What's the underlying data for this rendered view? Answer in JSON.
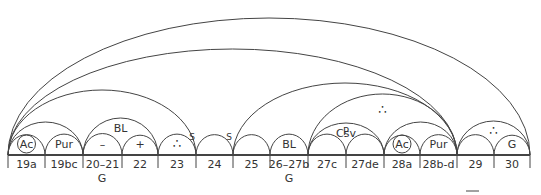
{
  "diagram": {
    "baseline_y": 155,
    "stroke_color": "#444444",
    "cells": [
      {
        "label": "19a",
        "x0": 8,
        "x1": 45,
        "symbol": "Ac",
        "circled": true
      },
      {
        "label": "19bc",
        "x0": 45,
        "x1": 83,
        "symbol": "Pur",
        "circled": false
      },
      {
        "label": "20–21",
        "x0": 83,
        "x1": 122,
        "symbol": "–",
        "circled": false
      },
      {
        "label": "22",
        "x0": 122,
        "x1": 158,
        "symbol": "+",
        "circled": false
      },
      {
        "label": "23",
        "x0": 158,
        "x1": 196,
        "symbol": "∴",
        "circled": false
      },
      {
        "label": "24",
        "x0": 196,
        "x1": 233,
        "symbol": "",
        "circled": false
      },
      {
        "label": "25",
        "x0": 233,
        "x1": 270,
        "symbol": "",
        "circled": false
      },
      {
        "label": "26–27b",
        "x0": 270,
        "x1": 308,
        "symbol": "BL",
        "circled": false
      },
      {
        "label": "27c",
        "x0": 308,
        "x1": 346,
        "symbol": "",
        "circled": false
      },
      {
        "label": "27de",
        "x0": 346,
        "x1": 384,
        "symbol": "",
        "circled": false
      },
      {
        "label": "28a",
        "x0": 384,
        "x1": 420,
        "symbol": "Ac",
        "circled": true
      },
      {
        "label": "28b-d",
        "x0": 420,
        "x1": 457,
        "symbol": "Pur",
        "circled": false
      },
      {
        "label": "29",
        "x0": 457,
        "x1": 494,
        "symbol": "",
        "circled": false
      },
      {
        "label": "30",
        "x0": 494,
        "x1": 530,
        "symbol": "G",
        "circled": false
      }
    ],
    "spans": [
      {
        "x0": 8,
        "x1": 83,
        "peak": 122,
        "label": ""
      },
      {
        "x0": 83,
        "x1": 158,
        "peak": 118,
        "label": "BL"
      },
      {
        "x0": 308,
        "x1": 384,
        "peak": 123,
        "label": "Csv"
      },
      {
        "x0": 384,
        "x1": 457,
        "peak": 122,
        "label": ""
      },
      {
        "x0": 457,
        "x1": 530,
        "peak": 121,
        "label": "∴"
      },
      {
        "x0": 8,
        "x1": 196,
        "peak": 90,
        "label": ""
      },
      {
        "x0": 233,
        "x1": 457,
        "peak": 83,
        "label": ""
      },
      {
        "x0": 308,
        "x1": 457,
        "peak": 94,
        "label": "∴"
      },
      {
        "x0": 8,
        "x1": 457,
        "peak": 49,
        "label": ""
      },
      {
        "x0": 8,
        "x1": 530,
        "peak": 18,
        "label": ""
      }
    ],
    "node_marks": [
      {
        "x": 196,
        "label": "S"
      },
      {
        "x": 233,
        "label": "S"
      },
      {
        "x": 346,
        "label": "P"
      }
    ],
    "group_labels": [
      {
        "x": 102,
        "label": "G"
      },
      {
        "x": 289,
        "label": "G"
      }
    ]
  }
}
